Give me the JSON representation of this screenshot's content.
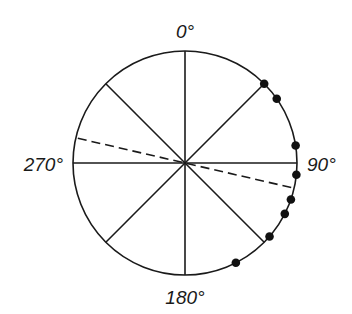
{
  "diagram": {
    "type": "circular-plot",
    "labels": {
      "top": "0°",
      "right": "90°",
      "bottom": "180°",
      "left": "270°"
    },
    "sector_lines_deg": [
      0,
      45,
      90,
      135,
      180,
      225,
      270,
      315
    ],
    "mean_direction_deg": 103,
    "data_points_deg": [
      45,
      55,
      81,
      96,
      109,
      117,
      131,
      153
    ]
  },
  "chart_data": {
    "type": "scatter",
    "title": "",
    "coordinate_system": "circular",
    "axis_labels": [
      "0°",
      "90°",
      "180°",
      "270°"
    ],
    "angles_deg": [
      45,
      55,
      81,
      96,
      109,
      117,
      131,
      153
    ],
    "mean_vector_deg": 103
  },
  "colors": {
    "line": "#1a1a1a",
    "background": "#ffffff"
  }
}
